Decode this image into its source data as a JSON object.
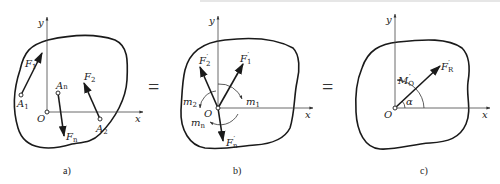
{
  "figure": {
    "panels": [
      {
        "id": "a",
        "caption": "a)",
        "axes": {
          "x": "x",
          "y": "y",
          "origin": "O"
        },
        "points": [
          {
            "name": "A",
            "sub": "1"
          },
          {
            "name": "A",
            "sub": "n"
          },
          {
            "name": "A",
            "sub": "2"
          }
        ],
        "forces": [
          {
            "name": "F",
            "sub": "1"
          },
          {
            "name": "F",
            "sub": "2"
          },
          {
            "name": "F",
            "sub": "n"
          }
        ]
      },
      {
        "id": "b",
        "caption": "b)",
        "axes": {
          "x": "x",
          "y": "y",
          "origin": "O"
        },
        "forces": [
          {
            "name": "F",
            "sub": "1",
            "prime": "′"
          },
          {
            "name": "F",
            "sub": "2",
            "prime": "′"
          },
          {
            "name": "F",
            "sub": "n",
            "prime": "′"
          }
        ],
        "moments": [
          {
            "name": "m",
            "sub": "1"
          },
          {
            "name": "m",
            "sub": "2"
          },
          {
            "name": "m",
            "sub": "n"
          }
        ]
      },
      {
        "id": "c",
        "caption": "c)",
        "axes": {
          "x": "x",
          "y": "y",
          "origin": "O"
        },
        "resultant": {
          "name": "F",
          "sub": "R",
          "prime": "′"
        },
        "moment": {
          "name": "M",
          "sub": "O",
          "prime": "′"
        },
        "angle": "α"
      }
    ],
    "equals": [
      "=",
      "="
    ]
  }
}
